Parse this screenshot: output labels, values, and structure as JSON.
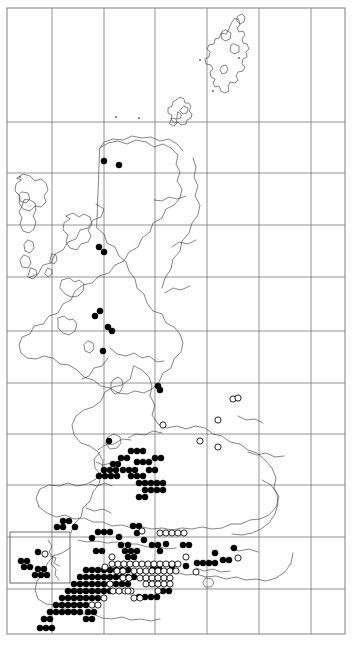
{
  "figure": {
    "kind": "species-distribution-map",
    "region_label": "Britain and Ireland",
    "background_color": "#ffffff",
    "frame_color": "#8a8a8a",
    "coastline_color": "#3a3a3a",
    "grid_color": "#6e6e6e",
    "filled_symbol_color": "#000000",
    "open_symbol_color": "#ffffff",
    "width": 353,
    "height": 648
  },
  "frame": {
    "x": 7,
    "y": 8,
    "width": 338,
    "height": 626
  },
  "inset": {
    "name": "channel-islands-inset",
    "x": 10,
    "y": 532,
    "width": 60,
    "height": 51
  },
  "grid": {
    "vertical_x": [
      52,
      104,
      155,
      207,
      259,
      311
    ],
    "horizontal_y": [
      122,
      173,
      225,
      277,
      331,
      383,
      434,
      485,
      537,
      589
    ],
    "spacing_px": 52
  },
  "legend": {
    "filled_meaning": "recorded present",
    "open_meaning": "historical or unconfirmed record"
  },
  "chart_data": {
    "type": "scatter",
    "title": "",
    "xlabel": "",
    "ylabel": "",
    "xlim": [
      7,
      345
    ],
    "ylim": [
      8,
      634
    ],
    "grid": true,
    "legend_position": "none",
    "series": [
      {
        "name": "filled",
        "symbol": "filled-circle",
        "radius": 3.1,
        "count": 163,
        "points": [
          [
            104,
            161
          ],
          [
            119,
            165
          ],
          [
            99,
            247
          ],
          [
            104,
            252
          ],
          [
            95,
            316
          ],
          [
            100,
            311
          ],
          [
            108,
            327
          ],
          [
            112,
            331
          ],
          [
            103,
            351
          ],
          [
            158,
            386
          ],
          [
            160,
            390
          ],
          [
            109,
            441
          ],
          [
            131,
            451
          ],
          [
            137,
            451
          ],
          [
            143,
            451
          ],
          [
            121,
            458
          ],
          [
            127,
            458
          ],
          [
            113,
            464
          ],
          [
            118,
            464
          ],
          [
            137,
            462
          ],
          [
            143,
            462
          ],
          [
            149,
            462
          ],
          [
            155,
            458
          ],
          [
            161,
            458
          ],
          [
            104,
            470
          ],
          [
            110,
            470
          ],
          [
            116,
            470
          ],
          [
            99,
            476
          ],
          [
            105,
            476
          ],
          [
            111,
            476
          ],
          [
            117,
            476
          ],
          [
            123,
            470
          ],
          [
            129,
            470
          ],
          [
            135,
            470
          ],
          [
            131,
            476
          ],
          [
            137,
            476
          ],
          [
            143,
            476
          ],
          [
            149,
            470
          ],
          [
            155,
            470
          ],
          [
            139,
            483
          ],
          [
            145,
            483
          ],
          [
            151,
            483
          ],
          [
            157,
            483
          ],
          [
            163,
            483
          ],
          [
            145,
            490
          ],
          [
            151,
            490
          ],
          [
            139,
            497
          ],
          [
            145,
            497
          ],
          [
            157,
            490
          ],
          [
            163,
            490
          ],
          [
            63,
            521
          ],
          [
            69,
            521
          ],
          [
            57,
            527
          ],
          [
            63,
            527
          ],
          [
            75,
            527
          ],
          [
            98,
            532
          ],
          [
            104,
            532
          ],
          [
            110,
            532
          ],
          [
            92,
            538
          ],
          [
            119,
            537
          ],
          [
            133,
            526
          ],
          [
            139,
            526
          ],
          [
            152,
            545
          ],
          [
            158,
            545
          ],
          [
            166,
            544
          ],
          [
            197,
            563
          ],
          [
            203,
            563
          ],
          [
            209,
            563
          ],
          [
            215,
            563
          ],
          [
            223,
            560
          ],
          [
            229,
            560
          ],
          [
            186,
            566
          ],
          [
            144,
            540
          ],
          [
            96,
            551
          ],
          [
            102,
            551
          ],
          [
            125,
            551
          ],
          [
            131,
            551
          ],
          [
            137,
            551
          ],
          [
            128,
            557
          ],
          [
            134,
            557
          ],
          [
            121,
            545
          ],
          [
            128,
            545
          ],
          [
            86,
            570
          ],
          [
            92,
            570
          ],
          [
            98,
            570
          ],
          [
            104,
            570
          ],
          [
            110,
            570
          ],
          [
            116,
            570
          ],
          [
            122,
            570
          ],
          [
            128,
            570
          ],
          [
            80,
            577
          ],
          [
            86,
            577
          ],
          [
            92,
            577
          ],
          [
            98,
            577
          ],
          [
            104,
            577
          ],
          [
            110,
            577
          ],
          [
            116,
            577
          ],
          [
            122,
            577
          ],
          [
            128,
            577
          ],
          [
            134,
            577
          ],
          [
            74,
            584
          ],
          [
            80,
            584
          ],
          [
            86,
            584
          ],
          [
            92,
            584
          ],
          [
            98,
            584
          ],
          [
            104,
            584
          ],
          [
            110,
            584
          ],
          [
            116,
            584
          ],
          [
            122,
            584
          ],
          [
            128,
            584
          ],
          [
            68,
            591
          ],
          [
            74,
            591
          ],
          [
            80,
            591
          ],
          [
            86,
            591
          ],
          [
            92,
            591
          ],
          [
            98,
            591
          ],
          [
            104,
            591
          ],
          [
            110,
            591
          ],
          [
            62,
            598
          ],
          [
            68,
            598
          ],
          [
            74,
            598
          ],
          [
            80,
            598
          ],
          [
            86,
            598
          ],
          [
            92,
            598
          ],
          [
            98,
            598
          ],
          [
            56,
            605
          ],
          [
            62,
            605
          ],
          [
            68,
            605
          ],
          [
            74,
            605
          ],
          [
            80,
            605
          ],
          [
            86,
            605
          ],
          [
            50,
            612
          ],
          [
            56,
            612
          ],
          [
            62,
            612
          ],
          [
            68,
            612
          ],
          [
            74,
            612
          ],
          [
            80,
            612
          ],
          [
            88,
            612
          ],
          [
            94,
            612
          ],
          [
            44,
            619
          ],
          [
            50,
            619
          ],
          [
            86,
            619
          ],
          [
            92,
            619
          ],
          [
            139,
            597
          ],
          [
            145,
            597
          ],
          [
            151,
            597
          ],
          [
            157,
            597
          ],
          [
            163,
            591
          ],
          [
            169,
            591
          ],
          [
            40,
            628
          ],
          [
            46,
            628
          ],
          [
            52,
            628
          ],
          [
            153,
            569
          ],
          [
            159,
            569
          ],
          [
            172,
            566
          ],
          [
            183,
            545
          ],
          [
            189,
            545
          ],
          [
            137,
            533
          ],
          [
            160,
            551
          ],
          [
            215,
            553
          ],
          [
            234,
            548
          ]
        ]
      },
      {
        "name": "open",
        "symbol": "open-circle",
        "radius": 3.1,
        "count": 62,
        "points": [
          [
            163,
            425
          ],
          [
            218,
            420
          ],
          [
            233,
            399
          ],
          [
            238,
            398
          ],
          [
            200,
            441
          ],
          [
            218,
            447
          ],
          [
            238,
            558
          ],
          [
            105,
            567
          ],
          [
            142,
            531
          ],
          [
            160,
            533
          ],
          [
            166,
            533
          ],
          [
            172,
            533
          ],
          [
            178,
            533
          ],
          [
            184,
            533
          ],
          [
            112,
            564
          ],
          [
            118,
            564
          ],
          [
            124,
            564
          ],
          [
            130,
            564
          ],
          [
            136,
            564
          ],
          [
            142,
            564
          ],
          [
            148,
            564
          ],
          [
            154,
            564
          ],
          [
            160,
            564
          ],
          [
            166,
            564
          ],
          [
            172,
            564
          ],
          [
            178,
            564
          ],
          [
            117,
            571
          ],
          [
            123,
            571
          ],
          [
            134,
            571
          ],
          [
            140,
            571
          ],
          [
            146,
            571
          ],
          [
            152,
            571
          ],
          [
            158,
            571
          ],
          [
            164,
            571
          ],
          [
            170,
            571
          ],
          [
            176,
            571
          ],
          [
            123,
            578
          ],
          [
            129,
            578
          ],
          [
            140,
            578
          ],
          [
            146,
            578
          ],
          [
            152,
            578
          ],
          [
            158,
            578
          ],
          [
            164,
            578
          ],
          [
            170,
            578
          ],
          [
            113,
            591
          ],
          [
            119,
            591
          ],
          [
            125,
            591
          ],
          [
            131,
            591
          ],
          [
            134,
            598
          ],
          [
            140,
            598
          ],
          [
            104,
            598
          ],
          [
            92,
            605
          ],
          [
            98,
            605
          ],
          [
            146,
            584
          ],
          [
            152,
            584
          ],
          [
            158,
            584
          ],
          [
            164,
            584
          ],
          [
            170,
            584
          ],
          [
            158,
            591
          ],
          [
            128,
            591
          ],
          [
            110,
            584
          ],
          [
            196,
            572
          ],
          [
            112,
            557
          ],
          [
            186,
            557
          ]
        ]
      },
      {
        "name": "inset-filled",
        "symbol": "filled-circle",
        "radius": 3.1,
        "count": 10,
        "points": [
          [
            38,
            552
          ],
          [
            21,
            561
          ],
          [
            27,
            561
          ],
          [
            24,
            567
          ],
          [
            30,
            567
          ],
          [
            35,
            575
          ],
          [
            41,
            575
          ],
          [
            47,
            575
          ],
          [
            38,
            569
          ],
          [
            44,
            569
          ]
        ]
      },
      {
        "name": "inset-open",
        "symbol": "open-circle",
        "radius": 3.1,
        "count": 1,
        "points": [
          [
            45,
            554
          ]
        ]
      },
      {
        "name": "tiny-marks",
        "symbol": "tiny-dot",
        "radius": 0.9,
        "count": 6,
        "points": [
          [
            20,
            177
          ],
          [
            200,
            60
          ],
          [
            239,
            58
          ],
          [
            213,
            91
          ],
          [
            116,
            117
          ],
          [
            139,
            118
          ]
        ]
      }
    ]
  }
}
